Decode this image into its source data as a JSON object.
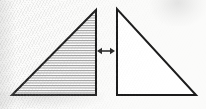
{
  "figure": {
    "title": "Two congruent right triangles separated by a horizontal double-headed arrow",
    "kind": "geometry-diagram",
    "background_color": "#fbfbfa",
    "stroke_color": "#1c1c1c",
    "hatch_color": "#8d8d8d",
    "canvas": {
      "width": 206,
      "height": 109
    },
    "shapes": [
      {
        "name": "left-triangle",
        "type": "right-triangle",
        "fill": "hatched",
        "fill_pattern": "horizontal-lines",
        "hatch_spacing_px": 2.5,
        "hatch_color": "#8d8d8d",
        "outline_color": "#1c1c1c",
        "outline_width_px": 2,
        "right_angle_at": "bottom-right",
        "points": "12,95 96,95 96,10",
        "vertices": [
          {
            "label": "bottom-left",
            "x": 12,
            "y": 95
          },
          {
            "label": "bottom-right",
            "x": 96,
            "y": 95
          },
          {
            "label": "apex-top",
            "x": 96,
            "y": 10
          }
        ]
      },
      {
        "name": "right-triangle",
        "type": "right-triangle",
        "fill": "none",
        "fill_pattern": "none",
        "hatch_spacing_px": 0,
        "hatch_color": "#ffffff",
        "outline_color": "#1c1c1c",
        "outline_width_px": 2,
        "right_angle_at": "bottom-left",
        "points": "117,9 117,95 196,95",
        "vertices": [
          {
            "label": "apex-top",
            "x": 117,
            "y": 9
          },
          {
            "label": "bottom-left",
            "x": 117,
            "y": 95
          },
          {
            "label": "bottom-right",
            "x": 196,
            "y": 95
          }
        ]
      }
    ],
    "arrow": {
      "name": "double-headed-arrow",
      "type": "double-arrow-horizontal",
      "color": "#2a2a2a",
      "shaft_width_px": 1.6,
      "head_length_px": 5,
      "head_half_height_px": 3.2,
      "x1": 97,
      "x2": 115,
      "y": 51
    }
  }
}
